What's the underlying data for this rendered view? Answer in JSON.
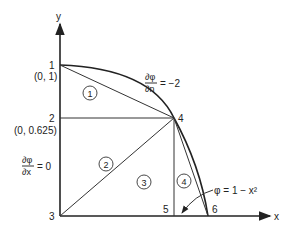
{
  "axes": {
    "x_label": "x",
    "y_label": "y"
  },
  "nodes": [
    {
      "id": "1",
      "coord_label": "(0, 1)"
    },
    {
      "id": "2",
      "coord_label": "(0, 0.625)"
    },
    {
      "id": "3",
      "coord_label": ""
    },
    {
      "id": "4",
      "coord_label": ""
    },
    {
      "id": "5",
      "coord_label": ""
    },
    {
      "id": "6",
      "coord_label": ""
    }
  ],
  "elements": [
    "1",
    "2",
    "3",
    "4"
  ],
  "annotations": {
    "normal_derivative": {
      "num": "∂φ",
      "den": "∂n",
      "rhs": "= −2"
    },
    "x_derivative": {
      "num": "∂φ",
      "den": "∂x",
      "rhs": "= 0"
    },
    "boundary_equation": "φ = 1 − x²"
  }
}
